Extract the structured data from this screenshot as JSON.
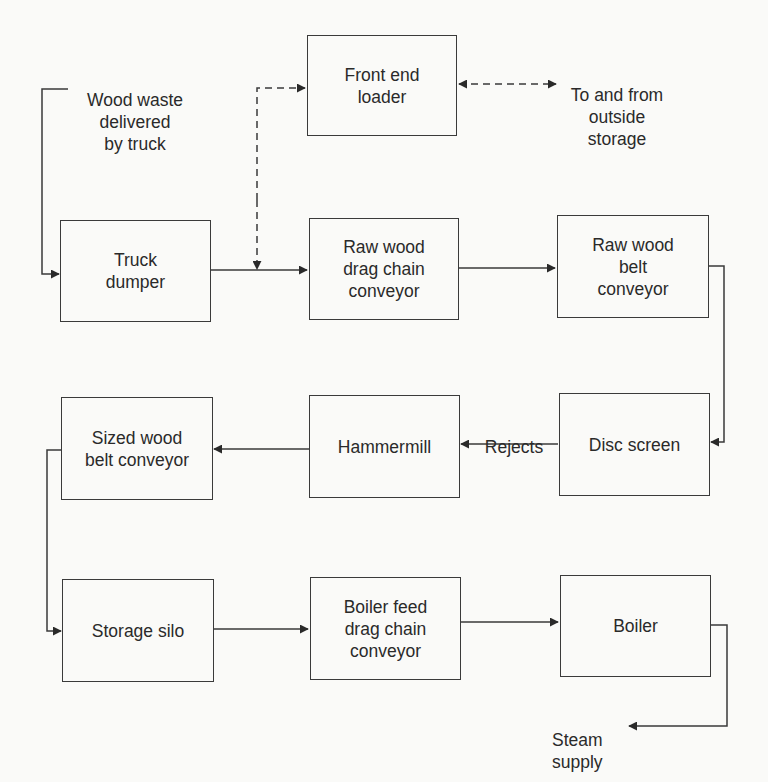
{
  "diagram": {
    "type": "process flow diagram",
    "nodes": [
      {
        "id": "front_end_loader",
        "label": "Front end\nloader"
      },
      {
        "id": "truck_dumper",
        "label": "Truck\ndumper"
      },
      {
        "id": "raw_wood_drag_chain",
        "label": "Raw wood\ndrag chain\nconveyor"
      },
      {
        "id": "raw_wood_belt",
        "label": "Raw wood\nbelt\nconveyor"
      },
      {
        "id": "sized_wood_belt",
        "label": "Sized wood\nbelt conveyor"
      },
      {
        "id": "hammermill",
        "label": "Hammermill"
      },
      {
        "id": "disc_screen",
        "label": "Disc screen"
      },
      {
        "id": "storage_silo",
        "label": "Storage silo"
      },
      {
        "id": "boiler_feed_drag_chain",
        "label": "Boiler feed\ndrag chain\nconveyor"
      },
      {
        "id": "boiler",
        "label": "Boiler"
      }
    ],
    "labels": {
      "wood_waste": "Wood waste\ndelivered\nby truck",
      "outside_storage": "To and from\noutside\nstorage",
      "rejects": "Rejects",
      "steam_supply": "Steam\nsupply"
    },
    "edges": [
      {
        "from": "wood_waste",
        "to": "truck_dumper",
        "style": "solid"
      },
      {
        "from": "truck_dumper",
        "to": "raw_wood_drag_chain",
        "style": "solid"
      },
      {
        "from": "truck_dumper",
        "to": "front_end_loader",
        "style": "dashed"
      },
      {
        "from": "front_end_loader",
        "to": "raw_wood_drag_chain",
        "style": "dashed"
      },
      {
        "from": "front_end_loader",
        "to": "outside_storage",
        "style": "dashed",
        "bidirectional": true
      },
      {
        "from": "raw_wood_drag_chain",
        "to": "raw_wood_belt",
        "style": "solid"
      },
      {
        "from": "raw_wood_belt",
        "to": "disc_screen",
        "style": "solid"
      },
      {
        "from": "disc_screen",
        "to": "hammermill",
        "style": "solid",
        "label": "Rejects"
      },
      {
        "from": "hammermill",
        "to": "sized_wood_belt",
        "style": "solid"
      },
      {
        "from": "sized_wood_belt",
        "to": "storage_silo",
        "style": "solid"
      },
      {
        "from": "storage_silo",
        "to": "boiler_feed_drag_chain",
        "style": "solid"
      },
      {
        "from": "boiler_feed_drag_chain",
        "to": "boiler",
        "style": "solid"
      },
      {
        "from": "boiler",
        "to": "steam_supply",
        "style": "solid"
      }
    ]
  }
}
